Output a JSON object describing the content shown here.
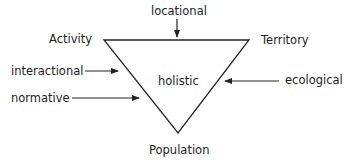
{
  "diagram": {
    "vertices": {
      "top_left": "Activity",
      "top_right": "Territory",
      "bottom": "Population"
    },
    "center_label": "holistic",
    "arrows": [
      {
        "label": "locational",
        "direction": "down",
        "target": "top edge"
      },
      {
        "label": "interactional",
        "direction": "right",
        "target": "left edge"
      },
      {
        "label": "normative",
        "direction": "right",
        "target": "left edge"
      },
      {
        "label": "ecological",
        "direction": "left",
        "target": "right edge"
      }
    ],
    "line_color": "#222222",
    "text_color": "#222222"
  }
}
